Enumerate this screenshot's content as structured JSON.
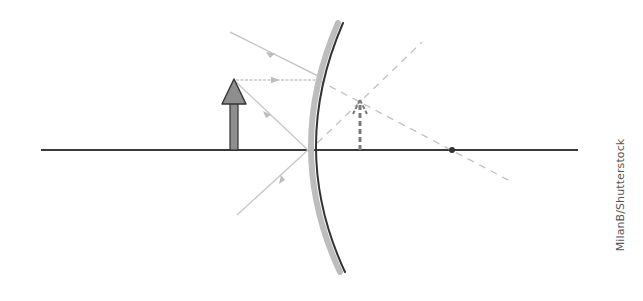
{
  "diagram": {
    "colors": {
      "background": "#ffffff",
      "axis": "#3a3a3a",
      "mirror_edge": "#333333",
      "mirror_band": "#b8b8b8",
      "object_fill": "#8e8e8e",
      "object_stroke": "#333333",
      "ray": "#c8c8c8",
      "ray_marker": "#bdbdbd",
      "construction_dashed": "#c4c4c4",
      "image_dashed": "#7a7a7a",
      "focal_point": "#333333"
    },
    "principal_axis": {
      "x1": 41,
      "y1": 150,
      "x2": 578,
      "y2": 150
    },
    "mirror": {
      "type": "convex",
      "top": {
        "x": 343,
        "y": 23
      },
      "pole": {
        "x": 311,
        "y": 150
      },
      "bottom": {
        "x": 345,
        "y": 272
      }
    },
    "object": {
      "label": "object",
      "x": 234,
      "base_y": 150,
      "tip_y": 79
    },
    "image": {
      "label": "virtual image",
      "x": 360,
      "base_y": 150,
      "tip_y": 100
    },
    "focal_point": {
      "x": 452,
      "y": 150
    },
    "rays": [
      {
        "name": "incident-ray-oblique",
        "x1": 230,
        "y1": 32,
        "x2": 318,
        "y2": 76
      },
      {
        "name": "incident-ray-parallel",
        "x1": 236,
        "y1": 80,
        "x2": 318,
        "y2": 80
      },
      {
        "name": "incident-ray-to-pole",
        "x1": 236,
        "y1": 82,
        "x2": 308,
        "y2": 150
      },
      {
        "name": "reflected-ray-from-pole",
        "x1": 308,
        "y1": 150,
        "x2": 237,
        "y2": 215
      }
    ],
    "dashed_lines": [
      {
        "name": "extension-through-focus",
        "x1": 318,
        "y1": 80,
        "x2": 512,
        "y2": 182
      },
      {
        "name": "extension-from-pole",
        "x1": 308,
        "y1": 152,
        "x2": 422,
        "y2": 42
      }
    ]
  },
  "watermark": {
    "text": "MilanB/Shutterstock"
  }
}
